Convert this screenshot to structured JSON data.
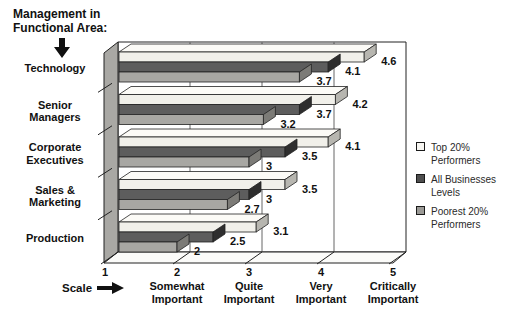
{
  "title": "Management in\nFunctional Area:",
  "scale_label": "Scale",
  "icons": {
    "title_arrow": "down-arrow",
    "scale_arrow": "right-arrow"
  },
  "colors": {
    "background": "#ffffff",
    "text": "#111111",
    "outline": "#222222",
    "wall_face": "#a9a8a4",
    "back_wall": "#ffffff",
    "floor": "#fbfbf9",
    "gridline": "#666666"
  },
  "chart_data": {
    "type": "bar",
    "orientation": "horizontal",
    "title": "Management in Functional Area:",
    "categories": [
      "Technology",
      "Senior\nManagers",
      "Corporate\nExecutives",
      "Sales &\nMarketing",
      "Production"
    ],
    "series": [
      {
        "name": "Top 20%\nPerformers",
        "values": [
          4.6,
          4.2,
          4.1,
          3.5,
          3.1
        ],
        "color_front": "#f1f0ea",
        "color_top": "#fcfbf7",
        "color_cap": "#b7b6b0",
        "swatch": "#f7f6f2"
      },
      {
        "name": "All Businesses\nLevels",
        "values": [
          4.1,
          3.7,
          3.5,
          3,
          2.5
        ],
        "color_front": "#5d5d5d",
        "color_top": "#6e6e6e",
        "color_cap": "#2e2e2e",
        "swatch": "#4e4e4e"
      },
      {
        "name": "Poorest 20%\nPerformers",
        "values": [
          3.7,
          3.2,
          3,
          2.7,
          2
        ],
        "color_front": "#a8a7a3",
        "color_top": "#bcbbb7",
        "color_cap": "#7c7b77",
        "swatch": "#9b9a96"
      }
    ],
    "xlim": [
      1,
      5
    ],
    "x_ticks": [
      {
        "value": 1,
        "label": ""
      },
      {
        "value": 2,
        "label": "Somewhat\nImportant"
      },
      {
        "value": 3,
        "label": "Quite\nImportant"
      },
      {
        "value": 4,
        "label": "Very\nImportant"
      },
      {
        "value": 5,
        "label": "Critically\nImportant"
      }
    ],
    "xlabel": "Scale",
    "grid": true,
    "legend_position": "right",
    "value_labels": true
  }
}
